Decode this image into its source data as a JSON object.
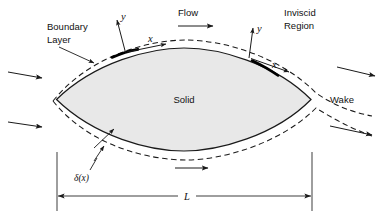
{
  "figure": {
    "background_color": "#ffffff",
    "line_color": "#1a1a1a",
    "body_fill_color": "#e8e8e8"
  },
  "labels": {
    "boundary_layer_line1": "Boundary",
    "boundary_layer_line2": "Layer",
    "flow": "Flow",
    "inviscid_line1": "Inviscid",
    "inviscid_line2": "Region",
    "solid": "Solid",
    "wake": "Wake",
    "delta": "δ(x)",
    "length": "L",
    "axis_y_left": "y",
    "axis_x_left": "x",
    "axis_y_right": "y",
    "axis_x_right": "x"
  },
  "annotations": {
    "body_shape": "symmetric lens / airfoil-like solid body",
    "dimension_name": "chord length L",
    "coordinate_systems": 2,
    "inflow_arrows": 2,
    "outflow_arrows": 2,
    "top_flow_arrows": 1,
    "bottom_flow_arrows": 1
  }
}
